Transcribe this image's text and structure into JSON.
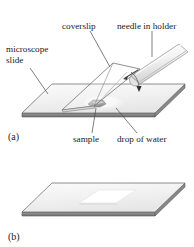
{
  "figure": {
    "title_visible": false,
    "panels": [
      {
        "id": "a",
        "label": "(a)"
      },
      {
        "id": "b",
        "label": "(b)"
      }
    ],
    "labels": {
      "coverslip": "coverslip",
      "needle_in_holder": "needle in holder",
      "microscope_slide_line1": "microscope",
      "microscope_slide_line2": "slide",
      "sample": "sample",
      "drop_of_water": "drop of water"
    },
    "colors": {
      "background": "#ffffff",
      "slide_top_fill": "#f2f2f2",
      "slide_edge_fill": "#8a8a8a",
      "slide_outline": "#5d5d5d",
      "coverslip_outline": "#6b6b6b",
      "holder_fill": "#f5f5f5",
      "holder_outline": "#8e8e8e",
      "sample_fill": "#b0b0b0",
      "leader_line": "#4a4a4a",
      "text": "#1b1b1b",
      "coverslip_flat_fill": "#fbfbfb"
    }
  }
}
